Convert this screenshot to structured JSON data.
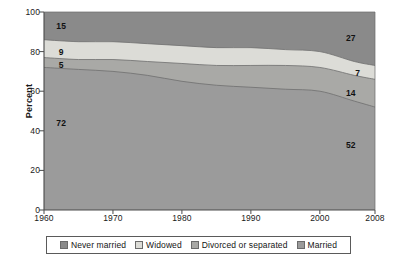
{
  "chart_data": {
    "type": "area",
    "stacked": true,
    "title": "",
    "subtitle": "",
    "xlabel": "",
    "ylabel": "Percent",
    "xlim": [
      1960,
      2008
    ],
    "ylim": [
      0,
      100
    ],
    "grid": false,
    "legend_position": "bottom",
    "x": [
      1960,
      1965,
      1970,
      1975,
      1980,
      1985,
      1990,
      1995,
      2000,
      2005,
      2008
    ],
    "xticks": [
      "1960",
      "1970",
      "1980",
      "1990",
      "2000",
      "2008"
    ],
    "xtick_values": [
      1960,
      1970,
      1980,
      1990,
      2000,
      2008
    ],
    "yticks": [
      "0",
      "20",
      "40",
      "60",
      "80",
      "100"
    ],
    "ytick_values": [
      0,
      20,
      40,
      60,
      80,
      100
    ],
    "series": [
      {
        "name": "Married",
        "color": "#9b9b9b",
        "order": 1,
        "values": [
          72,
          71,
          70,
          68,
          65,
          63,
          62,
          61,
          60,
          55,
          52
        ],
        "start_value": 72,
        "end_value": 52
      },
      {
        "name": "Divorced or separated",
        "color": "#a9a9a6",
        "order": 2,
        "values": [
          5,
          5,
          6,
          7,
          9,
          10,
          11,
          12,
          12,
          13,
          14
        ],
        "start_value": 5,
        "end_value": 14
      },
      {
        "name": "Widowed",
        "color": "#dcdcd7",
        "order": 3,
        "values": [
          9,
          9,
          9,
          9,
          9,
          9,
          9,
          8,
          8,
          7,
          7
        ],
        "start_value": 9,
        "end_value": 7
      },
      {
        "name": "Never married",
        "color": "#8a8a8a",
        "order": 4,
        "values": [
          15,
          15,
          16,
          17,
          18,
          19,
          19,
          20,
          21,
          25,
          27
        ],
        "start_value": 15,
        "end_value": 27
      }
    ],
    "annotations": [
      {
        "text": "15",
        "x": 1962.5,
        "y_pct": 93,
        "series": "Never married",
        "side": "left"
      },
      {
        "text": "9",
        "x": 1962.5,
        "y_pct": 80,
        "series": "Widowed",
        "side": "left"
      },
      {
        "text": "5",
        "x": 1962.5,
        "y_pct": 73,
        "series": "Divorced or separated",
        "side": "left"
      },
      {
        "text": "72",
        "x": 1962.5,
        "y_pct": 44,
        "series": "Married",
        "side": "left"
      },
      {
        "text": "27",
        "x": 2004.5,
        "y_pct": 87,
        "series": "Never married",
        "side": "right"
      },
      {
        "text": "7",
        "x": 2005.5,
        "y_pct": 69,
        "series": "Widowed",
        "side": "right"
      },
      {
        "text": "14",
        "x": 2004.5,
        "y_pct": 59,
        "series": "Divorced or separated",
        "side": "right"
      },
      {
        "text": "52",
        "x": 2004.5,
        "y_pct": 33,
        "series": "Married",
        "side": "right"
      }
    ]
  },
  "axis": {
    "y_title": "Percent",
    "y_ticks": [
      "100",
      "80",
      "60",
      "40",
      "20",
      "0"
    ],
    "x_ticks": [
      "1960",
      "1970",
      "1980",
      "1990",
      "2000",
      "2008"
    ]
  },
  "legend": {
    "items": [
      {
        "label": "Never married",
        "color": "#8a8a8a"
      },
      {
        "label": "Widowed",
        "color": "#dcdcd7"
      },
      {
        "label": "Divorced or separated",
        "color": "#a9a9a6"
      },
      {
        "label": "Married",
        "color": "#9b9b9b"
      }
    ]
  }
}
